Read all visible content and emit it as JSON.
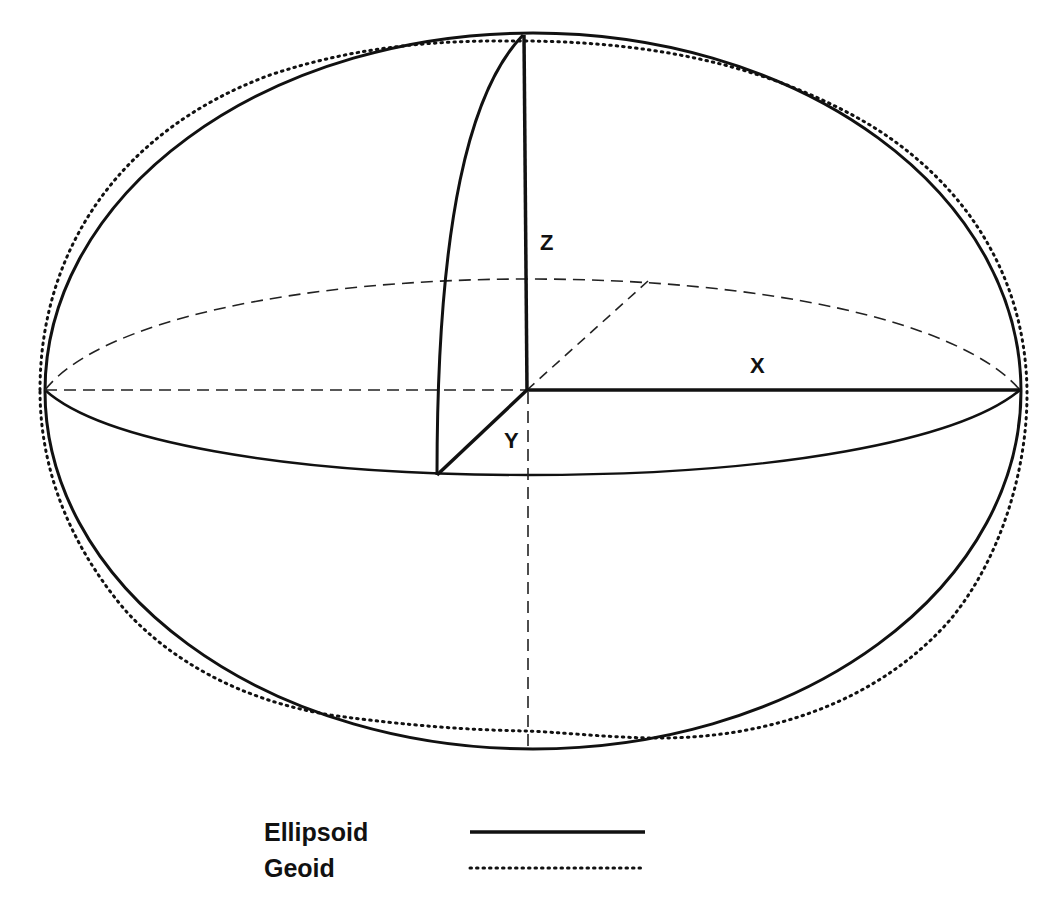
{
  "diagram": {
    "axes": {
      "z_label": "Z",
      "x_label": "X",
      "y_label": "Y"
    },
    "legend": {
      "items": [
        {
          "label": "Ellipsoid",
          "style": "solid"
        },
        {
          "label": "Geoid",
          "style": "dotted"
        }
      ]
    },
    "colors": {
      "stroke": "#111111",
      "background": "#ffffff"
    }
  }
}
